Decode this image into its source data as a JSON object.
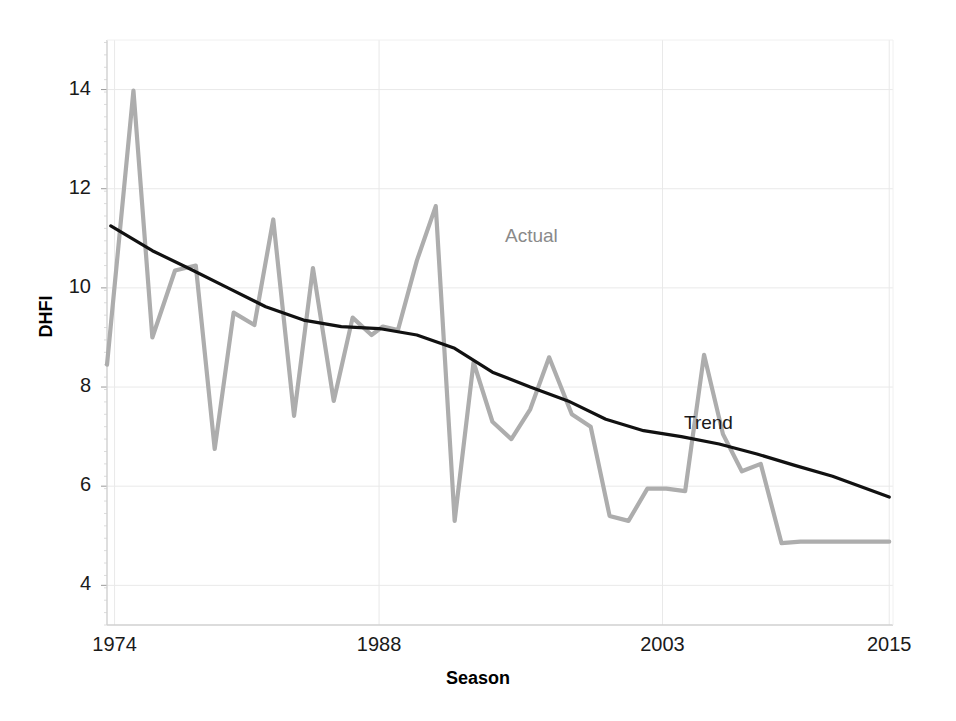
{
  "figure": {
    "ghost_title": "",
    "background": "#ffffff"
  },
  "axes": {
    "x_title": "Season",
    "y_title": "DHFI",
    "x_ticks": [
      "1974",
      "1988",
      "2003",
      "2015"
    ],
    "y_ticks": [
      "14",
      "12",
      "10",
      "8",
      "6",
      "4"
    ]
  },
  "labels": {
    "actual": "Actual",
    "trend": "Trend"
  },
  "colors": {
    "actual": "#adadad",
    "trend": "#111111",
    "grid": "#e9e9e9",
    "axis": "#d0d0d0",
    "tick_text": "#1a1a1a"
  },
  "chart_data": {
    "type": "line",
    "title": "",
    "xlabel": "Season",
    "ylabel": "DHFI",
    "xlim": [
      1973.6,
      2015.2
    ],
    "ylim": [
      3.2,
      15.0
    ],
    "grid": true,
    "legend_position": "inline-annotation",
    "annotations": [
      {
        "text": "Actual",
        "x": 1996.5,
        "y": 11.0,
        "color": "#8a8a8a"
      },
      {
        "text": "Trend",
        "x": 2007.0,
        "y": 7.45,
        "color": "#111111"
      }
    ],
    "x_tick_values": [
      1974,
      1988,
      2003,
      2015
    ],
    "y_tick_values": [
      4,
      6,
      8,
      10,
      12,
      14
    ],
    "series": [
      {
        "name": "Actual",
        "color": "#adadad",
        "x": [
          1973.6,
          1975.0,
          1976.0,
          1977.2,
          1978.3,
          1979.3,
          1980.3,
          1981.4,
          1982.4,
          1983.5,
          1984.5,
          1985.6,
          1986.6,
          1987.6,
          1988.2,
          1989.0,
          1990.0,
          1991.0,
          1992.0,
          1993.0,
          1994.0,
          1995.0,
          1996.0,
          1997.0,
          1998.2,
          1999.2,
          2000.2,
          2001.2,
          2002.2,
          2003.2,
          2004.2,
          2005.2,
          2006.2,
          2007.2,
          2008.2,
          2009.3,
          2010.3,
          2011.3,
          2012.3,
          2013.3,
          2014.2,
          2015.0
        ],
        "y": [
          8.45,
          13.98,
          9.0,
          10.35,
          10.45,
          6.75,
          9.5,
          9.25,
          11.38,
          7.42,
          10.4,
          7.72,
          9.4,
          9.05,
          9.22,
          9.15,
          10.55,
          11.65,
          5.3,
          8.5,
          7.3,
          6.95,
          7.55,
          8.6,
          7.45,
          7.2,
          5.4,
          5.3,
          5.95,
          5.95,
          5.9,
          8.65,
          7.05,
          6.3,
          6.45,
          4.85,
          4.88,
          4.88,
          4.88,
          4.88,
          4.88,
          4.88
        ]
      },
      {
        "name": "Trend",
        "color": "#111111",
        "x": [
          1973.8,
          1976.0,
          1978.0,
          1980.0,
          1982.0,
          1984.0,
          1986.0,
          1988.0,
          1990.0,
          1992.0,
          1994.0,
          1996.0,
          1998.0,
          2000.0,
          2002.0,
          2004.0,
          2006.0,
          2008.0,
          2010.0,
          2012.0,
          2015.0
        ],
        "y": [
          11.25,
          10.75,
          10.38,
          10.0,
          9.62,
          9.35,
          9.22,
          9.18,
          9.05,
          8.78,
          8.3,
          8.0,
          7.72,
          7.35,
          7.12,
          7.0,
          6.85,
          6.65,
          6.42,
          6.2,
          5.78
        ]
      }
    ]
  },
  "plot_geometry": {
    "left": 107,
    "top": 40,
    "right": 893,
    "bottom": 625
  }
}
